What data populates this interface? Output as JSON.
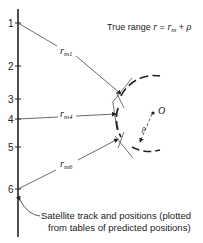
{
  "title": {
    "prefix": "True range ",
    "formula_r": "r",
    "equals": " = ",
    "formula_rm": "r",
    "formula_rm_sub": "m",
    "plus": " + ",
    "formula_rho": "ρ"
  },
  "track": {
    "ticks": [
      {
        "label": "1",
        "y": 23
      },
      {
        "label": "2",
        "y": 66
      },
      {
        "label": "3",
        "y": 99
      },
      {
        "label": "4",
        "y": 119
      },
      {
        "label": "5",
        "y": 147
      },
      {
        "label": "6",
        "y": 189
      }
    ]
  },
  "ranges": [
    {
      "base": "r",
      "sub": "m1"
    },
    {
      "base": "r",
      "sub": "m4"
    },
    {
      "base": "r",
      "sub": "m6"
    }
  ],
  "center": {
    "label": "O",
    "rho": "ρ"
  },
  "caption": {
    "line1": "Satellite track and positions (plotted",
    "line2": "from tables of predicted positions)"
  },
  "colors": {
    "ink": "#222222",
    "background": "#ffffff"
  }
}
